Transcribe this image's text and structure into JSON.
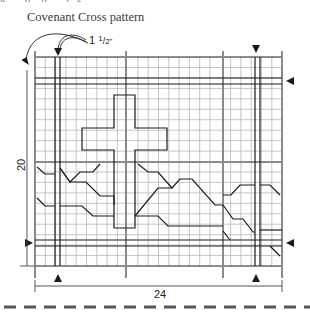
{
  "caption_fragment": "g... ...p... p... ...j...s",
  "title": "Covenant Cross pattern",
  "measure_offset": "1 1/2\"",
  "dimensions": {
    "height_label": "20",
    "width_label": "24"
  },
  "grid": {
    "columns": 24,
    "rows": 20
  },
  "colors": {
    "major_line": "#8a8a8a",
    "minor_line": "#b5b5b5",
    "outline": "#1a1a1a",
    "dash": "#555555"
  },
  "markers": [
    {
      "position": "top",
      "target": "left doubled vertical",
      "direction": "down"
    },
    {
      "position": "top",
      "target": "right doubled vertical",
      "direction": "down"
    },
    {
      "position": "right",
      "target": "upper doubled horizontal",
      "direction": "left"
    },
    {
      "position": "right",
      "target": "lower doubled horizontal",
      "direction": "left"
    },
    {
      "position": "left",
      "target": "lower doubled horizontal",
      "direction": "right"
    },
    {
      "position": "bottom",
      "target": "left doubled vertical",
      "direction": "up"
    },
    {
      "position": "bottom",
      "target": "right doubled vertical",
      "direction": "up"
    }
  ],
  "motif": "cross",
  "cut_line": "dashed"
}
